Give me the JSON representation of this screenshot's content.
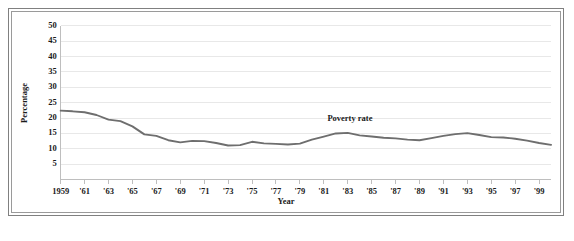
{
  "chart_data": {
    "type": "line",
    "title": "",
    "xlabel": "Year",
    "ylabel": "Percentage",
    "xlim": [
      1959,
      2000
    ],
    "ylim": [
      0,
      50
    ],
    "yticks": [
      5,
      10,
      15,
      20,
      25,
      30,
      35,
      40,
      45,
      50
    ],
    "ytick_labels": [
      "5",
      "10",
      "15",
      "20",
      "25",
      "30",
      "35",
      "40",
      "45",
      "50"
    ],
    "xtick_values": [
      1959,
      1961,
      1963,
      1965,
      1967,
      1969,
      1971,
      1973,
      1975,
      1977,
      1979,
      1981,
      1983,
      1985,
      1987,
      1989,
      1991,
      1993,
      1995,
      1997,
      1999
    ],
    "xtick_labels": [
      "1959",
      "'61",
      "'63",
      "'65",
      "'67",
      "'69",
      "'71",
      "'73",
      "'75",
      "'77",
      "'79",
      "'81",
      "'83",
      "'85",
      "'87",
      "'89",
      "'91",
      "'93",
      "'95",
      "'97",
      "'99"
    ],
    "grid": true,
    "grid_axis": "y",
    "legend_position": "inline-annotation",
    "series": [
      {
        "name": "Poverty rate",
        "color": "#6e6e6e",
        "x": [
          1959,
          1960,
          1961,
          1962,
          1963,
          1964,
          1965,
          1966,
          1967,
          1968,
          1969,
          1970,
          1971,
          1972,
          1973,
          1974,
          1975,
          1976,
          1977,
          1978,
          1979,
          1980,
          1981,
          1982,
          1983,
          1984,
          1985,
          1986,
          1987,
          1988,
          1989,
          1990,
          1991,
          1992,
          1993,
          1994,
          1995,
          1996,
          1997,
          1998,
          1999,
          2000
        ],
        "values": [
          22.4,
          22.2,
          21.9,
          21.0,
          19.5,
          19.0,
          17.3,
          14.7,
          14.2,
          12.8,
          12.1,
          12.6,
          12.5,
          11.9,
          11.1,
          11.2,
          12.3,
          11.8,
          11.6,
          11.4,
          11.7,
          13.0,
          14.0,
          15.0,
          15.2,
          14.4,
          14.0,
          13.6,
          13.4,
          13.0,
          12.8,
          13.5,
          14.2,
          14.8,
          15.1,
          14.5,
          13.8,
          13.7,
          13.3,
          12.7,
          11.9,
          11.3
        ]
      }
    ]
  },
  "annotations": {
    "poverty_rate_label": "Poverty rate"
  },
  "colors": {
    "line": "#6e6e6e",
    "gridline": "#e8e8e8",
    "axis": "#bdbdbd",
    "text": "#1a1a1a",
    "frame_outer": "#808080",
    "frame_inner": "#9a9a9a",
    "background": "#ffffff"
  }
}
